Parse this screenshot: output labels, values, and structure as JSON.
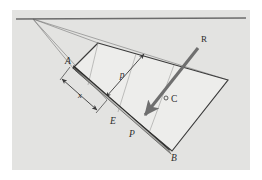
{
  "figure": {
    "background_color": "#e3e3e1",
    "page_color": "#ffffff",
    "line_color": "#3a3a3a",
    "thin_line_color": "#8c8c8c",
    "plane_fill": "#ededeb",
    "beam_fill": "#b9b9b7",
    "arrow_color": "#6f6f6f",
    "labels": [
      {
        "id": "A",
        "text": "A",
        "x": 68,
        "y": 64,
        "style": "italic",
        "desc": "upper end of beam"
      },
      {
        "id": "B",
        "text": "B",
        "x": 174,
        "y": 156,
        "style": "italic",
        "desc": "lower end of beam"
      },
      {
        "id": "C",
        "text": "C",
        "x": 171,
        "y": 100,
        "style": "upright",
        "desc": "centroid point"
      },
      {
        "id": "E",
        "text": "E",
        "x": 117,
        "y": 122,
        "style": "italic",
        "desc": "point E on beam"
      },
      {
        "id": "P",
        "text": "P",
        "x": 134,
        "y": 135,
        "style": "italic",
        "desc": "point P on beam"
      },
      {
        "id": "R",
        "text": "R",
        "x": 203,
        "y": 44,
        "style": "upright",
        "desc": "resultant force vector"
      },
      {
        "id": "p",
        "text": "p",
        "x": 122,
        "y": 75,
        "style": "italic",
        "desc": "perpendicular distance p"
      },
      {
        "id": "x",
        "text": "x",
        "x": 80,
        "y": 95,
        "style": "italic",
        "desc": "distance x along beam"
      }
    ],
    "geometry": {
      "horizon_y": 19,
      "vanishing_point": {
        "x": 33,
        "y": 19
      },
      "plane_quad": [
        {
          "x": 98,
          "y": 43
        },
        {
          "x": 228,
          "y": 80
        },
        {
          "x": 172,
          "y": 151
        },
        {
          "x": 73,
          "y": 68
        }
      ],
      "beam_start": {
        "x": 74,
        "y": 68
      },
      "beam_end": {
        "x": 170,
        "y": 152
      },
      "force_start": {
        "x": 198,
        "y": 48
      },
      "force_end": {
        "x": 143,
        "y": 118
      },
      "c_marker": {
        "x": 166,
        "y": 98,
        "r": 2
      }
    }
  }
}
